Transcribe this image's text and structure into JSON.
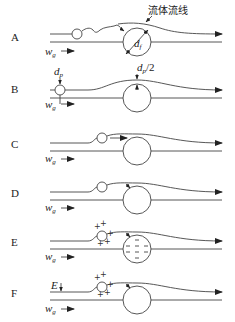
{
  "figure": {
    "callout_label": "流体流线",
    "panels": [
      {
        "id": "A",
        "label": "A",
        "velocity_label": "w",
        "velocity_sub": "g",
        "annotation": "d",
        "annotation_sub": "f",
        "description": "small particle follows streamline around collector"
      },
      {
        "id": "B",
        "label": "B",
        "velocity_label": "w",
        "velocity_sub": "g",
        "particle_label": "d",
        "particle_sub": "p",
        "offset_label": "d",
        "offset_sub": "p",
        "offset_suffix": "/2",
        "description": "interception"
      },
      {
        "id": "C",
        "label": "C",
        "velocity_label": "w",
        "velocity_sub": "g",
        "description": "inertial impaction"
      },
      {
        "id": "D",
        "label": "D",
        "velocity_label": "w",
        "velocity_sub": "g",
        "description": "diffusion"
      },
      {
        "id": "E",
        "label": "E",
        "velocity_label": "w",
        "velocity_sub": "g",
        "particle_charge": "+",
        "collector_charge": "−",
        "description": "electrostatic attraction"
      },
      {
        "id": "F",
        "label": "F",
        "velocity_label": "w",
        "velocity_sub": "g",
        "field_label": "E",
        "particle_charge": "+",
        "description": "external electric field"
      }
    ]
  },
  "colors": {
    "stroke": "#444444",
    "text": "#222222",
    "background": "#ffffff"
  }
}
